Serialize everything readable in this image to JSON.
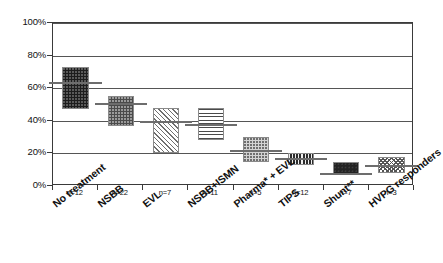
{
  "chart_data": {
    "type": "bar",
    "title": "",
    "xlabel": "",
    "ylabel": "",
    "ylim": [
      0,
      100
    ],
    "grid": true,
    "legend": "none",
    "y_ticks": [
      "0%",
      "20%",
      "40%",
      "60%",
      "80%",
      "100%"
    ],
    "y_tick_values": [
      0,
      20,
      40,
      60,
      80,
      100
    ],
    "categories": [
      "No treatment",
      "NSBB",
      "EVL",
      "NSBB+ISMN",
      "Pharma* + EVL",
      "TIPS",
      "Shunt**",
      "HVPG responders"
    ],
    "n_labels": [
      "n=12",
      "n=22",
      "n=7",
      "n=11",
      "n=5",
      "n=12",
      "n=7",
      "n=3"
    ],
    "n_values": [
      12,
      22,
      7,
      11,
      5,
      12,
      7,
      3
    ],
    "boxes": [
      {
        "category": "No treatment",
        "low": 47,
        "high": 73,
        "median": 64,
        "n": 12,
        "pattern": "dark-dots"
      },
      {
        "category": "NSBB",
        "low": 37,
        "high": 55,
        "median": 51,
        "n": 22,
        "pattern": "mid-dots"
      },
      {
        "category": "EVL",
        "low": 20,
        "high": 48,
        "median": 40,
        "n": 7,
        "pattern": "diagonal-hatch"
      },
      {
        "category": "NSBB+ISMN",
        "low": 28,
        "high": 48,
        "median": 38,
        "n": 11,
        "pattern": "horizontal-lines"
      },
      {
        "category": "Pharma* + EVL",
        "low": 15,
        "high": 30,
        "median": 22,
        "n": 5,
        "pattern": "light-dots"
      },
      {
        "category": "TIPS",
        "low": 13,
        "high": 20,
        "median": 17,
        "n": 12,
        "pattern": "vertical-lines"
      },
      {
        "category": "Shunt**",
        "low": 7,
        "high": 15,
        "median": 8,
        "n": 7,
        "pattern": "solid-dark"
      },
      {
        "category": "HVPG responders",
        "low": 8,
        "high": 18,
        "median": 13,
        "n": 3,
        "pattern": "checker"
      }
    ],
    "values": [
      64,
      51,
      40,
      38,
      22,
      17,
      8,
      13
    ]
  },
  "colors": {
    "axis": "#3a3a3a",
    "gridline": "#555555",
    "median_line": "#6d6d6d",
    "box_border": "#8a8a8a",
    "text": "#111111",
    "background": "#ffffff"
  }
}
